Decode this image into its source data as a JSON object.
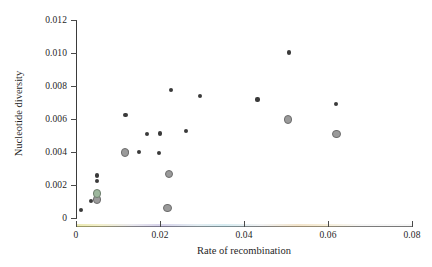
{
  "chart_data": {
    "type": "scatter",
    "title": "",
    "xlabel": "Rate of recombination",
    "ylabel": "Nucleotide diversity",
    "xlim": [
      0,
      0.08
    ],
    "ylim": [
      0,
      0.012
    ],
    "xticks": [
      0,
      0.02,
      0.04,
      0.06,
      0.08
    ],
    "xticklabels": [
      "0",
      "0.02",
      "0.04",
      "0.06",
      "0.08"
    ],
    "yticks": [
      0,
      0.002,
      0.004,
      0.006,
      0.008,
      0.01,
      0.012
    ],
    "yticklabels": [
      "0",
      "0.002",
      "0.004",
      "0.006",
      "0.008",
      "0.010",
      "0.012"
    ],
    "grid": false,
    "legend": null,
    "series": [
      {
        "name": "small-dot",
        "marker": "filled-circle-small",
        "color": "#3a3a3a",
        "points": [
          {
            "x": 0.0012,
            "y": 0.00046
          },
          {
            "x": 0.0035,
            "y": 0.00103
          },
          {
            "x": 0.005,
            "y": 0.00257
          },
          {
            "x": 0.005,
            "y": 0.00222
          },
          {
            "x": 0.005,
            "y": 0.0012
          },
          {
            "x": 0.0118,
            "y": 0.00625
          },
          {
            "x": 0.0122,
            "y": 0.00398
          },
          {
            "x": 0.015,
            "y": 0.00398
          },
          {
            "x": 0.017,
            "y": 0.0051
          },
          {
            "x": 0.0197,
            "y": 0.00396
          },
          {
            "x": 0.02,
            "y": 0.00512
          },
          {
            "x": 0.0227,
            "y": 0.00775
          },
          {
            "x": 0.0262,
            "y": 0.00528
          },
          {
            "x": 0.0295,
            "y": 0.0074
          },
          {
            "x": 0.0432,
            "y": 0.00718
          },
          {
            "x": 0.0507,
            "y": 0.01003
          },
          {
            "x": 0.062,
            "y": 0.00692
          }
        ]
      },
      {
        "name": "grey-circle",
        "marker": "open-circle-grey",
        "color": "#9a9a9a",
        "points": [
          {
            "x": 0.005,
            "y": 0.00112
          },
          {
            "x": 0.0117,
            "y": 0.00398
          },
          {
            "x": 0.0222,
            "y": 0.00268
          },
          {
            "x": 0.0218,
            "y": 0.0006
          },
          {
            "x": 0.0505,
            "y": 0.00598
          },
          {
            "x": 0.062,
            "y": 0.0051
          }
        ]
      },
      {
        "name": "green-circle",
        "marker": "open-circle-green",
        "color": "#9db79d",
        "points": [
          {
            "x": 0.005,
            "y": 0.00148
          }
        ]
      }
    ]
  }
}
